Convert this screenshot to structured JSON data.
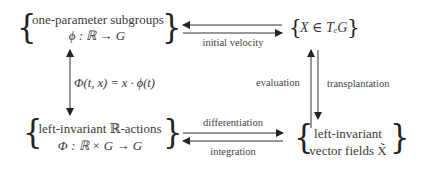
{
  "diagram": {
    "nodes": {
      "top_left": {
        "line1": "one-parameter subgroups",
        "line2": "ϕ : ℝ → G"
      },
      "top_right": {
        "line1": "X ∈ TₑG"
      },
      "bottom_left": {
        "line1": "left-invariant ℝ-actions",
        "line2": "Φ : ℝ × G → G"
      },
      "bottom_right": {
        "line1": "left-invariant",
        "line2": "vector fields X̃"
      }
    },
    "edges": {
      "top": "initial velocity",
      "left": "Φ(t, x) = x · ϕ(t)",
      "right_up": "evaluation",
      "right_down": "transplantation",
      "bottom_forward": "differentiation",
      "bottom_backward": "integration"
    },
    "braces": {
      "open": "{",
      "close": "}"
    },
    "colors": {
      "text": "#3a3a3a",
      "arrow": "#333333",
      "background": "#ffffff"
    }
  }
}
